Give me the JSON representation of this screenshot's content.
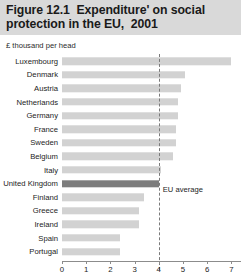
{
  "figure": {
    "title_line1": "Figure 12.1  Expenditure' on social",
    "title_line2": "protection in the EU,  2001",
    "subtitle": "£ thousand per head"
  },
  "colors": {
    "title_background": "#d9d9d9",
    "bar": "#d2d2d2",
    "bar_highlight": "#7d7d7d",
    "axis": "#8c8c8c",
    "average_line": "#7a7a7a"
  },
  "annotations": {
    "eu_average_label": "EU average"
  },
  "chart_data": {
    "type": "bar",
    "orientation": "horizontal",
    "title": "Figure 12.1  Expenditure' on social protection in the EU,  2001",
    "subtitle": "£ thousand per head",
    "xlabel": "£ thousand per head",
    "ylabel": "",
    "xlim": [
      0,
      7.4
    ],
    "xticks": [
      0,
      1,
      2,
      3,
      4,
      5,
      6,
      7
    ],
    "xtick_labels": [
      "0",
      "1",
      "2",
      "3",
      "4",
      "5",
      "6",
      "7"
    ],
    "grid": false,
    "legend": false,
    "highlight_category": "United Kingdom",
    "reference_line": {
      "label": "EU average",
      "value": 4.0,
      "style": "dashed"
    },
    "categories": [
      "Luxembourg",
      "Denmark",
      "Austria",
      "Netherlands",
      "Germany",
      "France",
      "Sweden",
      "Belgium",
      "Italy",
      "United Kingdom",
      "Finland",
      "Greece",
      "Ireland",
      "Spain",
      "Portugal"
    ],
    "values": [
      7.0,
      5.1,
      4.9,
      4.8,
      4.8,
      4.7,
      4.7,
      4.6,
      4.1,
      4.0,
      3.4,
      3.2,
      3.2,
      2.4,
      2.4
    ]
  }
}
